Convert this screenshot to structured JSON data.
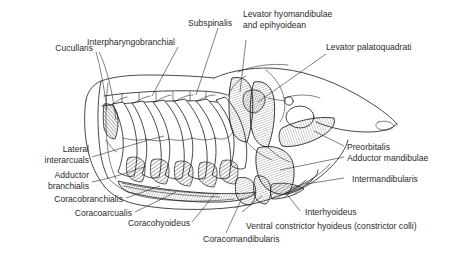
{
  "figure": {
    "background_color": "#ffffff",
    "ink_color": "#1a1a1a",
    "text_color": "#2b2b2b"
  },
  "labels": {
    "cucullaris": "Cucullaris",
    "interpharyngobranchial": "Interpharyngobranchial",
    "subspinalis": "Subspinalis",
    "levator_hyomandibulae_1": "Levator hyomandibulae",
    "levator_hyomandibulae_2": "and epihyoidean",
    "levator_palatoquadrati": "Levator palatoquadrati",
    "preorbitalis": "Preorbitalis",
    "adductor_mandibulae": "Adductor mandibulae",
    "intermandibularis": "Intermandibularis",
    "interhyoideus": "Interhyoideus",
    "ventral_constrictor": "Ventral constrictor hyoideus (constrictor colli)",
    "coracomandibularis": "Coracomandibularis",
    "coracohyoideus": "Coracohyoideus",
    "coracoarcualis": "Coracoarcualis",
    "coracobranchialis": "Coracobranchialis",
    "adductor_branchialis_1": "Adductor",
    "adductor_branchialis_2": "branchialis",
    "lateral_interarcuals_1": "Lateral",
    "lateral_interarcuals_2": "interarcuals"
  }
}
